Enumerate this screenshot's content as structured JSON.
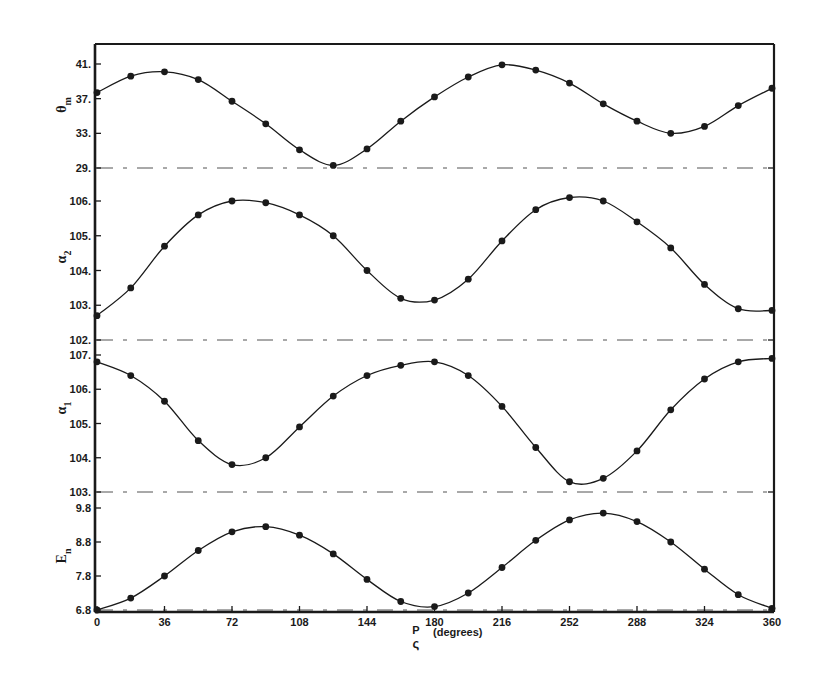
{
  "chart_data": {
    "type": "line",
    "title": "",
    "xlabel": "ρ_P (degrees)",
    "xlabel_symbol": "P",
    "xlabel_subglyph": "ς",
    "xlabel_unit": "(degrees)",
    "x_ticks": [
      0,
      36,
      72,
      108,
      144,
      180,
      216,
      252,
      288,
      324,
      360
    ],
    "xlim": [
      0,
      360
    ],
    "grid": false,
    "legend": null,
    "x": [
      0,
      18,
      36,
      54,
      72,
      90,
      108,
      126,
      144,
      162,
      180,
      198,
      216,
      234,
      252,
      270,
      288,
      306,
      324,
      342,
      360
    ],
    "panels": [
      {
        "name": "theta_m",
        "ylabel": "θm",
        "ylabel_main": "θ",
        "ylabel_sub": "m",
        "y_ticks": [
          "41.",
          "37.",
          "33.",
          "29."
        ],
        "y_tick_values": [
          41,
          37,
          33,
          29
        ],
        "ylim": [
          29,
          41.2
        ],
        "baseline": 29,
        "values": [
          37.7,
          39.6,
          40.1,
          39.2,
          36.7,
          34.1,
          31.1,
          29.3,
          31.2,
          34.4,
          37.2,
          39.5,
          40.9,
          40.3,
          38.8,
          36.4,
          34.4,
          33.0,
          33.8,
          36.2,
          38.2
        ]
      },
      {
        "name": "alpha_2",
        "ylabel": "α2",
        "ylabel_main": "α",
        "ylabel_sub": "2",
        "y_ticks": [
          "106.",
          "105.",
          "104.",
          "103.",
          "102."
        ],
        "y_tick_values": [
          106,
          105,
          104,
          103,
          102
        ],
        "ylim": [
          102,
          106.2
        ],
        "baseline": 102,
        "values": [
          102.7,
          103.5,
          104.7,
          105.6,
          106.0,
          105.95,
          105.6,
          105.0,
          104.0,
          103.2,
          103.15,
          103.75,
          104.85,
          105.75,
          106.1,
          106.0,
          105.4,
          104.65,
          103.6,
          102.9,
          102.85
        ]
      },
      {
        "name": "alpha_1",
        "ylabel": "α1",
        "ylabel_main": "α",
        "ylabel_sub": "1",
        "y_ticks": [
          "107.",
          "106.",
          "105.",
          "104.",
          "103."
        ],
        "y_tick_values": [
          107,
          106,
          105,
          104,
          103
        ],
        "ylim": [
          103,
          107
        ],
        "baseline": 103,
        "values": [
          106.8,
          106.4,
          105.65,
          104.5,
          103.8,
          104.0,
          104.9,
          105.8,
          106.4,
          106.7,
          106.8,
          106.4,
          105.5,
          104.3,
          103.3,
          103.4,
          104.2,
          105.4,
          106.3,
          106.8,
          106.9
        ]
      },
      {
        "name": "E_n",
        "ylabel": "En",
        "ylabel_main": "E",
        "ylabel_sub": "n",
        "y_ticks": [
          "9.8",
          "8.8",
          "7.8",
          "6.8"
        ],
        "y_tick_values": [
          9.8,
          8.8,
          7.8,
          6.8
        ],
        "ylim": [
          6.8,
          9.8
        ],
        "baseline": 6.8,
        "values": [
          6.8,
          7.15,
          7.8,
          8.55,
          9.1,
          9.25,
          9.0,
          8.45,
          7.7,
          7.05,
          6.9,
          7.3,
          8.05,
          8.85,
          9.45,
          9.65,
          9.4,
          8.8,
          8.0,
          7.25,
          6.85
        ]
      }
    ],
    "colors": {
      "ink": "#1a1a1a",
      "background": "#ffffff"
    }
  }
}
